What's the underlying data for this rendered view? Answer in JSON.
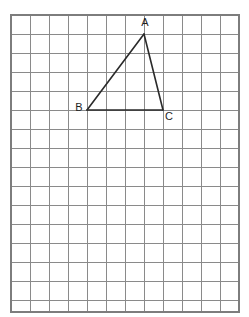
{
  "figure": {
    "canvas": {
      "width": 249,
      "height": 317,
      "background": "#ffffff"
    }
  },
  "grid": {
    "name": "square-grid",
    "origin_x": 11,
    "origin_y": 15,
    "cell_size": 19,
    "cols": 12,
    "rows": 16,
    "right_edge": 239,
    "bottom_edge": 312,
    "line_color": "#8a8a8a",
    "line_width": 1,
    "border_color": "#7d7d7d",
    "border_width": 1.2
  },
  "shape": {
    "name": "triangle-abc",
    "stroke_color": "#2a2a2a",
    "stroke_width": 1.6,
    "fill": "none",
    "vertices": [
      {
        "id": "A",
        "label": "A",
        "x": 144,
        "y": 34,
        "grid_col": 7,
        "grid_row": 1,
        "label_x": 145,
        "label_y": 23,
        "label_anchor": "middle"
      },
      {
        "id": "B",
        "label": "B",
        "x": 87,
        "y": 110,
        "grid_col": 4,
        "grid_row": 5,
        "label_x": 79,
        "label_y": 108,
        "label_anchor": "middle"
      },
      {
        "id": "C",
        "label": "C",
        "x": 163,
        "y": 110,
        "grid_col": 8,
        "grid_row": 5,
        "label_x": 169,
        "label_y": 117,
        "label_anchor": "middle"
      }
    ],
    "edges": [
      {
        "id": "AB",
        "from": "A",
        "to": "B"
      },
      {
        "id": "BC",
        "from": "B",
        "to": "C"
      },
      {
        "id": "CA",
        "from": "C",
        "to": "A"
      }
    ]
  },
  "chart_data": {
    "type": "scatter",
    "xlabel": "",
    "ylabel": "",
    "grid": true,
    "legend": "none",
    "x": [
      7,
      4,
      8
    ],
    "y": [
      1,
      5,
      5
    ],
    "point_labels": [
      "A",
      "B",
      "C"
    ],
    "xlim": [
      0,
      12
    ],
    "ylim": [
      0,
      16
    ],
    "annotations": [
      "Grid units measured from top-left corner of grid",
      "Base BC spans 4 grid cells",
      "Apex A is 4 grid cells above line BC"
    ]
  }
}
